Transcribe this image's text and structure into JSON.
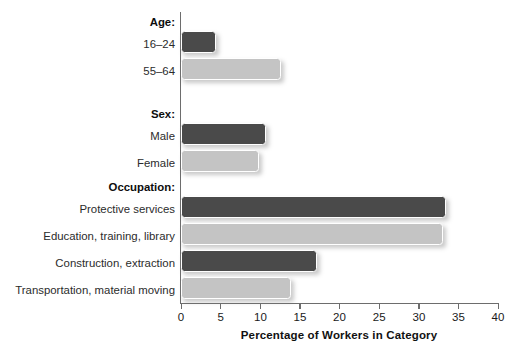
{
  "chart_data": {
    "type": "bar",
    "orientation": "horizontal",
    "title": "",
    "xlabel": "Percentage of Workers in Category",
    "ylabel": "",
    "xlim": [
      0,
      40
    ],
    "xticks": [
      0,
      5,
      10,
      15,
      20,
      25,
      30,
      35,
      40
    ],
    "xtick_labels": [
      "0",
      "5",
      "10",
      "15",
      "20",
      "25",
      "30",
      "35",
      "40"
    ],
    "grid": false,
    "legend": "none",
    "colors": {
      "dark": "#4a4a4a",
      "light": "#c4c4c4",
      "axis": "#6d6d6d",
      "background": "#ffffff"
    },
    "groups": [
      {
        "label": "Age:",
        "categories": [
          "16–24",
          "55–64"
        ],
        "values": [
          4.4,
          12.6
        ],
        "shades": [
          "dark",
          "light"
        ]
      },
      {
        "label": "Sex:",
        "categories": [
          "Male",
          "Female"
        ],
        "values": [
          10.7,
          9.8
        ],
        "shades": [
          "dark",
          "light"
        ]
      },
      {
        "label": "Occupation:",
        "categories": [
          "Protective services",
          "Education, training, library",
          "Construction, extraction",
          "Transportation, material moving"
        ],
        "values": [
          33.4,
          33.1,
          17.2,
          13.9
        ],
        "shades": [
          "dark",
          "light",
          "dark",
          "light"
        ]
      }
    ],
    "categories": [
      "16–24",
      "55–64",
      "Male",
      "Female",
      "Protective services",
      "Education, training, library",
      "Construction, extraction",
      "Transportation, material moving"
    ],
    "values": [
      4.4,
      12.6,
      10.7,
      9.8,
      33.4,
      33.1,
      17.2,
      13.9
    ]
  },
  "axis": {
    "xlabel": "Percentage of Workers in Category",
    "ticks": [
      {
        "value": "0"
      },
      {
        "value": "5"
      },
      {
        "value": "10"
      },
      {
        "value": "15"
      },
      {
        "value": "20"
      },
      {
        "value": "25"
      },
      {
        "value": "30"
      },
      {
        "value": "35"
      },
      {
        "value": "40"
      }
    ]
  },
  "groups": {
    "age": {
      "header": "Age:",
      "rows": [
        {
          "label": "16–24"
        },
        {
          "label": "55–64"
        }
      ]
    },
    "sex": {
      "header": "Sex:",
      "rows": [
        {
          "label": "Male"
        },
        {
          "label": "Female"
        }
      ]
    },
    "occupation": {
      "header": "Occupation:",
      "rows": [
        {
          "label": "Protective services"
        },
        {
          "label": "Education, training, library"
        },
        {
          "label": "Construction, extraction"
        },
        {
          "label": "Transportation, material moving"
        }
      ]
    }
  }
}
